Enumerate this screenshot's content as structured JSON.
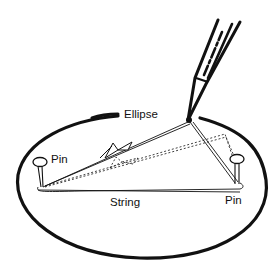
{
  "diagram": {
    "labels": {
      "ellipse": "Ellipse",
      "pin_left": "Pin",
      "pin_right": "Pin",
      "string": "String"
    },
    "elements": [
      {
        "name": "ellipse-outline",
        "kind": "curve"
      },
      {
        "name": "pencil",
        "kind": "drawing-tool"
      },
      {
        "name": "pin-left",
        "kind": "pin"
      },
      {
        "name": "pin-right",
        "kind": "pin"
      },
      {
        "name": "string-loop",
        "kind": "string"
      },
      {
        "name": "string-knot",
        "kind": "knot"
      },
      {
        "name": "alternate-string-position",
        "kind": "dotted-string"
      }
    ],
    "colors": {
      "ink": "#111111",
      "background": "#ffffff"
    }
  }
}
